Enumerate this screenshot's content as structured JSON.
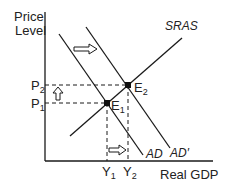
{
  "diagram": {
    "type": "AD-AS model",
    "axes": {
      "y_label_line1": "Price",
      "y_label_line2": "Level",
      "x_label": "Real GDP"
    },
    "curves": {
      "sras": "SRAS",
      "ad": "AD",
      "ad_prime": "AD′"
    },
    "price_levels": {
      "p1": "P",
      "p1_sub": "1",
      "p2": "P",
      "p2_sub": "2"
    },
    "outputs": {
      "y1": "Y",
      "y1_sub": "1",
      "y2": "Y",
      "y2_sub": "2"
    },
    "equilibria": {
      "e1": "E",
      "e1_sub": "1",
      "e2": "E",
      "e2_sub": "2"
    },
    "shifts": [
      "AD shifts right to AD′",
      "Price level rises from P1 to P2",
      "Real GDP rises from Y1 to Y2"
    ],
    "colors": {
      "line": "#1a1a1a",
      "text": "#222222",
      "background": "#ffffff"
    }
  }
}
